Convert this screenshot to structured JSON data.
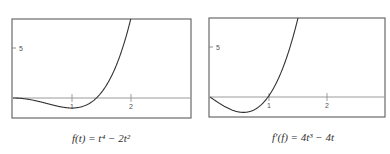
{
  "chart_data": [
    {
      "type": "line",
      "title": "",
      "caption": "f(t) = t⁴ − 2t²",
      "xlabel": "",
      "ylabel": "",
      "xticks": [
        "1",
        "2"
      ],
      "yticks": [
        "5"
      ],
      "xlim": [
        0,
        3.05
      ],
      "ylim": [
        -2,
        8
      ],
      "grid": false,
      "series": [
        {
          "name": "f(t)",
          "function": "t^4 - 2t^2",
          "x": [
            0,
            0.25,
            0.5,
            0.75,
            1.0,
            1.25,
            1.5,
            1.75,
            2.0,
            2.05
          ],
          "y": [
            0,
            -0.121,
            -0.438,
            -0.809,
            -1.0,
            -0.684,
            0.563,
            3.254,
            8.0,
            9.2
          ]
        }
      ]
    },
    {
      "type": "line",
      "title": "",
      "caption": "f′(f) = 4t³ − 4t",
      "xlabel": "",
      "ylabel": "",
      "xticks": [
        "1",
        "2"
      ],
      "yticks": [
        "5"
      ],
      "xlim": [
        0,
        3.05
      ],
      "ylim": [
        -2,
        8
      ],
      "grid": false,
      "series": [
        {
          "name": "f'(t)",
          "function": "4t^3 - 4t",
          "x": [
            0,
            0.25,
            0.5,
            0.577,
            0.75,
            1.0,
            1.25,
            1.5,
            1.6
          ],
          "y": [
            0,
            -0.938,
            -1.5,
            -1.54,
            -1.313,
            0,
            2.813,
            7.5,
            9.98
          ]
        }
      ]
    }
  ],
  "left": {
    "caption": "f(t) = t⁴ − 2t²",
    "ytick": "5",
    "xtick1": "1",
    "xtick2": "2"
  },
  "right": {
    "caption": "f′(f) = 4t³ − 4t",
    "ytick": "5",
    "xtick1": "1",
    "xtick2": "2"
  }
}
